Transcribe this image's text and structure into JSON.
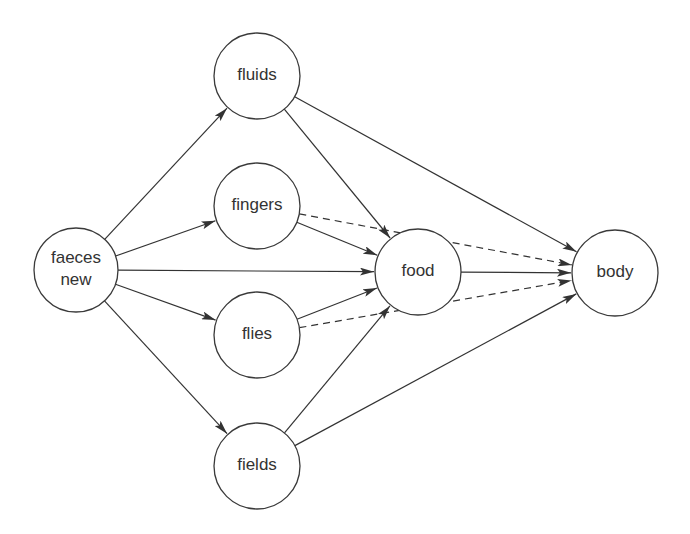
{
  "diagram": {
    "nodes": [
      {
        "id": "faeces",
        "lines": [
          "faeces",
          "new"
        ],
        "cx": 76,
        "cy": 270,
        "r": 42
      },
      {
        "id": "fluids",
        "lines": [
          "fluids"
        ],
        "cx": 257,
        "cy": 76,
        "r": 43
      },
      {
        "id": "fingers",
        "lines": [
          "fingers"
        ],
        "cx": 257,
        "cy": 206,
        "r": 43
      },
      {
        "id": "flies",
        "lines": [
          "flies"
        ],
        "cx": 257,
        "cy": 335,
        "r": 43
      },
      {
        "id": "fields",
        "lines": [
          "fields"
        ],
        "cx": 257,
        "cy": 466,
        "r": 43
      },
      {
        "id": "food",
        "lines": [
          "food"
        ],
        "cx": 418,
        "cy": 272,
        "r": 43
      },
      {
        "id": "body",
        "lines": [
          "body"
        ],
        "cx": 615,
        "cy": 273,
        "r": 43
      }
    ],
    "edges": [
      {
        "from": "faeces",
        "to": "fluids",
        "style": "solid"
      },
      {
        "from": "faeces",
        "to": "fingers",
        "style": "solid"
      },
      {
        "from": "faeces",
        "to": "food",
        "style": "solid"
      },
      {
        "from": "faeces",
        "to": "flies",
        "style": "solid"
      },
      {
        "from": "faeces",
        "to": "fields",
        "style": "solid"
      },
      {
        "from": "fluids",
        "to": "food",
        "style": "solid"
      },
      {
        "from": "fluids",
        "to": "body",
        "style": "solid"
      },
      {
        "from": "fingers",
        "to": "food",
        "style": "solid"
      },
      {
        "from": "fingers",
        "to": "body",
        "style": "dashed"
      },
      {
        "from": "flies",
        "to": "food",
        "style": "solid"
      },
      {
        "from": "flies",
        "to": "body",
        "style": "dashed"
      },
      {
        "from": "fields",
        "to": "food",
        "style": "solid"
      },
      {
        "from": "fields",
        "to": "body",
        "style": "solid"
      },
      {
        "from": "food",
        "to": "body",
        "style": "solid"
      }
    ]
  }
}
